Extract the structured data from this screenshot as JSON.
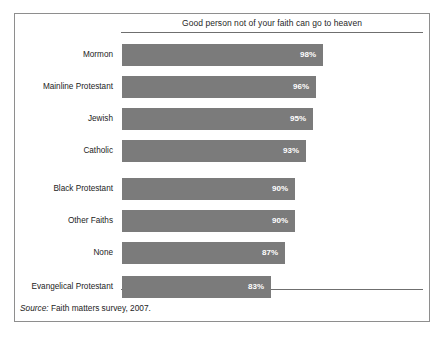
{
  "chart_data": {
    "type": "bar",
    "orientation": "horizontal",
    "title": "Good person not of your faith can go to heaven",
    "xlabel": "",
    "ylabel": "",
    "grid": false,
    "legend": null,
    "value_suffix": "%",
    "axis_note": "value axis is truncated; bars do not begin at zero",
    "categories": [
      "Mormon",
      "Mainline Protestant",
      "Jewish",
      "Catholic",
      "Black Protestant",
      "Other Faiths",
      "None",
      "Evangelical Protestant"
    ],
    "values": [
      98,
      96,
      95,
      93,
      90,
      90,
      87,
      83
    ],
    "value_labels": [
      "98%",
      "96%",
      "95%",
      "93%",
      "90%",
      "90%",
      "87%",
      "83%"
    ],
    "bar_color": "#7b7b7b",
    "value_label_color": "#ffffff",
    "frame_color": "#8e8e8e"
  },
  "source": {
    "label": "Source:",
    "text": " Faith matters survey, 2007."
  }
}
